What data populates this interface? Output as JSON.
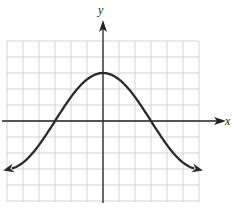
{
  "chart_data": {
    "type": "line",
    "title": "",
    "xlabel": "x",
    "ylabel": "y",
    "xlim": [
      -6,
      6
    ],
    "ylim": [
      -5,
      5
    ],
    "grid": true,
    "grid_step": 1,
    "function": "y = 3cos(pi*x/6)",
    "series": [
      {
        "name": "curve",
        "x": [
          -6,
          -5,
          -4,
          -3,
          -2,
          -1,
          0,
          1,
          2,
          3,
          4,
          5,
          6
        ],
        "values": [
          -3,
          -2.6,
          -1.5,
          0,
          1.5,
          2.6,
          3,
          2.6,
          1.5,
          0,
          -1.5,
          -2.6,
          -3
        ],
        "arrows_at_ends": true
      }
    ],
    "key_points": {
      "maximum": [
        0,
        3
      ],
      "x_intercepts": [
        [
          -3,
          0
        ],
        [
          3,
          0
        ]
      ]
    }
  },
  "axes": {
    "x_label": "x",
    "y_label": "y"
  },
  "colors": {
    "grid": "#d0d0d0",
    "axis": "#222222",
    "curve": "#2a2a2a"
  }
}
